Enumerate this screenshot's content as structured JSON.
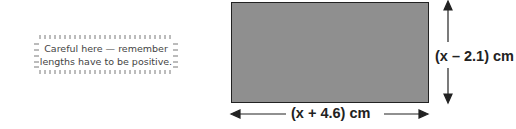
{
  "note": {
    "line1": "Careful here — remember",
    "line2": "lengths have to be positive."
  },
  "diagram": {
    "shape": "rectangle",
    "fill_color": "#8f8f8f",
    "width_label": "(x + 4.6) cm",
    "height_label": "(x – 2.1) cm"
  }
}
